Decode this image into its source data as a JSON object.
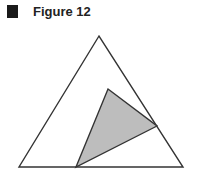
{
  "figure": {
    "title": "Figure 12",
    "marker_color": "#1a1a1a"
  },
  "diagram": {
    "outer_triangle": {
      "points": "99,36 19,167 183,167",
      "fill": "#ffffff",
      "stroke": "#333333"
    },
    "inner_triangle": {
      "points": "108,89 157,126 76,167",
      "fill": "#bdbdbd",
      "stroke": "#333333"
    }
  }
}
